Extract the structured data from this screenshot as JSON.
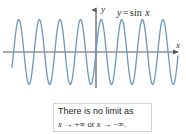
{
  "figure": {
    "function_label": {
      "lhs": "y",
      "equals": "=",
      "rhs_func": "sin",
      "rhs_var": "x"
    },
    "axes": {
      "y_label": "y",
      "x_label": "x"
    },
    "caption": {
      "line1": "There is no limit as",
      "line2_var1": "x",
      "line2_arrow1": "→",
      "line2_limit1": "+∞",
      "line2_conj": "or",
      "line2_var2": "x",
      "line2_arrow2": "→",
      "line2_limit2": "−∞."
    },
    "colors": {
      "curve": "#6f97bd",
      "axis": "#58595b",
      "text": "#231f20",
      "box_border": "#d2d3d5",
      "background": "#ffffff"
    }
  },
  "chart_data": {
    "type": "line",
    "title": "",
    "subtitle": "",
    "xlabel": "x",
    "ylabel": "y",
    "equation": "y = sin x",
    "series": [
      {
        "name": "y = sin x",
        "color": "#6f97bd",
        "amplitude": 1,
        "period_px": 20.6,
        "x_pixel_start": 12,
        "x_pixel_end": 178,
        "phase_zero_px": 96,
        "visible_peaks": 8,
        "visible_troughs": 9
      }
    ],
    "axis_origin_px": {
      "x": 96,
      "y": 52
    },
    "x_axis_pixel_y": 52,
    "y_axis_pixel_x": 96,
    "peak_pixel_y": 20,
    "trough_pixel_y": 85,
    "ylim": [
      -1,
      1
    ],
    "grid": false,
    "legend": "none",
    "tick_labels": [],
    "annotations": [
      "y = sin x",
      "There is no limit as x → +∞ or x → −∞."
    ]
  }
}
